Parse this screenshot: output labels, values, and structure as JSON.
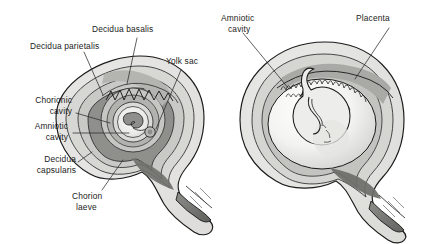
{
  "figure": {
    "title": "",
    "panels": [
      {
        "id": "panel-early-gestation",
        "labels": [
          {
            "id": "decidua-basalis",
            "text": "Decidua basalis",
            "line1": "Decidua basalis",
            "line2": ""
          },
          {
            "id": "decidua-parietalis",
            "text": "Decidua parietalis",
            "line1": "Decidua parietalis",
            "line2": ""
          },
          {
            "id": "yolk-sac",
            "text": "Yolk sac",
            "line1": "Yolk sac",
            "line2": ""
          },
          {
            "id": "chorionic-cavity",
            "text": "Chorionic cavity",
            "line1": "Chorionic",
            "line2": "cavity"
          },
          {
            "id": "amniotic-cavity",
            "text": "Amniotic cavity",
            "line1": "Amniotic",
            "line2": "cavity"
          },
          {
            "id": "decidua-capsularis",
            "text": "Decidua capsularis",
            "line1": "Decidua",
            "line2": "capsularis"
          },
          {
            "id": "chorion-laeve",
            "text": "Chorion laeve",
            "line1": "Chorion",
            "line2": "laeve"
          }
        ]
      },
      {
        "id": "panel-late-gestation",
        "labels": [
          {
            "id": "amniotic-cavity-2",
            "text": "Amniotic cavity",
            "line1": "Amniotic",
            "line2": "cavity"
          },
          {
            "id": "placenta",
            "text": "Placenta",
            "line1": "Placenta",
            "line2": ""
          }
        ]
      }
    ]
  },
  "colors": {
    "background": "#ffffff",
    "outline": "#1a1a1a",
    "text": "#1b1b1b",
    "leader": "#2b2b2b",
    "myometrium": "#e8e8e6",
    "decidua_parietalis": "#d2d2cf",
    "decidua_basalis": "#b6b6b2",
    "decidua_capsularis": "#8e8e8a",
    "chorionic_cavity": "#c4c4c0",
    "amniotic_cavity": "#f2f2f0",
    "embryo": "#9a9a96",
    "cervix_dark": "#6e6e6a",
    "cervix_mid": "#a5a5a1",
    "placenta_villi": "#9d9d99",
    "fetus": "#ededeb",
    "uterine_cavity": "#dcdcd9"
  }
}
